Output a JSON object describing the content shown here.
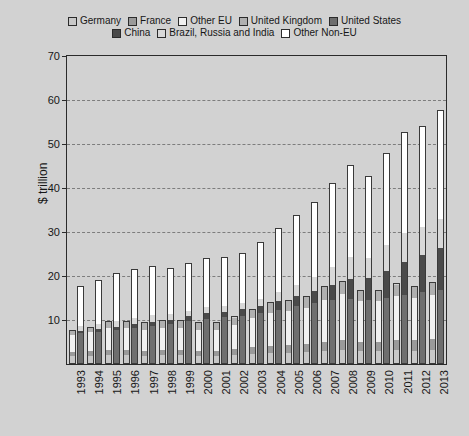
{
  "chart_data": {
    "type": "bar",
    "stacked": true,
    "title": "",
    "subtitle": "",
    "xlabel": "",
    "ylabel": "$ trillion",
    "ylim": [
      0,
      70
    ],
    "ytick_values": [
      10,
      20,
      30,
      40,
      50,
      60,
      70
    ],
    "ytick_labels": [
      "10",
      "20",
      "30",
      "40",
      "50",
      "60",
      "70"
    ],
    "grid": true,
    "grid_axis": "y",
    "grid_style": "dashed",
    "legend_position": "top",
    "bars_per_category": 2,
    "categories": [
      "1993",
      "1994",
      "1995",
      "1996",
      "1997",
      "1998",
      "1999",
      "2000",
      "2001",
      "2002",
      "2003",
      "2004",
      "2005",
      "2006",
      "2007",
      "2008",
      "2009",
      "2010",
      "2011",
      "2012",
      "2013"
    ],
    "series": [
      {
        "name": "Germany",
        "color": "#c8c8c8",
        "group": "EU",
        "values": [
          1.6,
          1.7,
          1.9,
          1.8,
          1.7,
          1.8,
          1.8,
          1.7,
          1.7,
          1.9,
          2.2,
          2.4,
          2.4,
          2.5,
          2.8,
          3.0,
          2.8,
          2.8,
          3.0,
          2.9,
          3.1
        ]
      },
      {
        "name": "France",
        "color": "#9a9a9a",
        "group": "EU",
        "values": [
          1.1,
          1.2,
          1.3,
          1.3,
          1.2,
          1.3,
          1.3,
          1.2,
          1.2,
          1.4,
          1.6,
          1.7,
          1.8,
          1.9,
          2.1,
          2.3,
          2.2,
          2.2,
          2.4,
          2.4,
          2.5
        ]
      },
      {
        "name": "Other EU",
        "color": "#f0f0f0",
        "group": "EU",
        "values": [
          4.0,
          4.5,
          5.2,
          5.2,
          5.0,
          5.3,
          5.2,
          4.9,
          5.0,
          5.7,
          6.8,
          7.7,
          7.9,
          8.5,
          9.9,
          10.7,
          9.5,
          9.4,
          10.3,
          9.8,
          10.3
        ]
      },
      {
        "name": "United Kingdom",
        "color": "#b0b0b0",
        "group": "EU",
        "values": [
          1.0,
          1.1,
          1.3,
          1.4,
          1.6,
          1.7,
          1.7,
          1.7,
          1.7,
          1.8,
          2.0,
          2.3,
          2.4,
          2.6,
          3.0,
          2.9,
          2.4,
          2.5,
          2.6,
          2.7,
          2.7
        ]
      },
      {
        "name": "United States",
        "color": "#6e6e6e",
        "group": "NonEU",
        "values": [
          6.9,
          7.3,
          7.6,
          8.1,
          8.6,
          9.1,
          9.7,
          10.3,
          10.6,
          10.9,
          11.5,
          12.3,
          13.1,
          13.9,
          14.5,
          14.7,
          14.4,
          15.0,
          15.5,
          16.2,
          16.8
        ]
      },
      {
        "name": "China",
        "color": "#4a4a4a",
        "group": "NonEU",
        "values": [
          0.6,
          0.6,
          0.7,
          0.9,
          1.0,
          1.0,
          1.1,
          1.2,
          1.3,
          1.5,
          1.6,
          1.9,
          2.3,
          2.7,
          3.5,
          4.6,
          5.1,
          6.1,
          7.6,
          8.5,
          9.5
        ]
      },
      {
        "name": "Brazil, Russia and India",
        "color": "#d8d8d8",
        "group": "NonEU",
        "values": [
          1.1,
          1.2,
          1.4,
          1.5,
          1.6,
          1.4,
          1.3,
          1.4,
          1.4,
          1.4,
          1.7,
          2.1,
          2.6,
          3.2,
          4.1,
          5.0,
          4.7,
          5.9,
          6.6,
          6.4,
          6.8
        ]
      },
      {
        "name": "Other Non-EU",
        "color": "#ffffff",
        "group": "NonEU",
        "values": [
          9.2,
          10.0,
          11.0,
          11.2,
          11.0,
          10.3,
          10.8,
          11.2,
          11.0,
          11.5,
          12.9,
          14.6,
          15.9,
          17.0,
          19.0,
          21.0,
          18.6,
          21.0,
          23.1,
          23.0,
          24.6
        ]
      }
    ],
    "eu_totals": [
      7.7,
      8.5,
      9.7,
      9.7,
      9.5,
      10.1,
      10.0,
      9.5,
      9.6,
      10.8,
      12.6,
      14.1,
      14.5,
      15.5,
      17.8,
      18.9,
      16.9,
      16.9,
      18.3,
      17.8,
      18.6
    ],
    "noneu_totals": [
      17.8,
      19.1,
      20.7,
      21.7,
      22.2,
      21.8,
      22.9,
      24.1,
      24.3,
      25.3,
      27.7,
      30.9,
      33.9,
      36.8,
      41.1,
      45.3,
      42.8,
      48.0,
      52.8,
      54.1,
      57.7
    ]
  },
  "legend": {
    "rows": [
      [
        {
          "label": "Germany",
          "color": "#c8c8c8"
        },
        {
          "label": "France",
          "color": "#9a9a9a"
        },
        {
          "label": "Other EU",
          "color": "#f0f0f0"
        },
        {
          "label": "United Kingdom",
          "color": "#b0b0b0"
        },
        {
          "label": "United States",
          "color": "#6e6e6e"
        }
      ],
      [
        {
          "label": "China",
          "color": "#4a4a4a"
        },
        {
          "label": "Brazil, Russia and India",
          "color": "#d8d8d8"
        },
        {
          "label": "Other Non-EU",
          "color": "#ffffff"
        }
      ]
    ]
  },
  "colors": {
    "background": "#d2d2d2",
    "axis": "#2b2b2b",
    "grid": "#7d7d7d",
    "text": "#171717"
  }
}
